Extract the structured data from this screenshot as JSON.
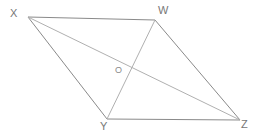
{
  "figure": {
    "background_color": "#ffffff",
    "width": 258,
    "height": 136,
    "side_color": "#8a8a8a",
    "diagonal_color": "#b0b0b0",
    "label_color": "#777777",
    "center_label_color": "#8a8a8a",
    "stroke_width": 1,
    "vertices": [
      {
        "name": "X",
        "label": "X",
        "x": 28,
        "y": 17,
        "label_x": 10,
        "label_y": 8
      },
      {
        "name": "W",
        "label": "W",
        "x": 155,
        "y": 20,
        "label_x": 158,
        "label_y": 5
      },
      {
        "name": "Y",
        "label": "Y",
        "x": 107,
        "y": 119,
        "label_x": 100,
        "label_y": 121
      },
      {
        "name": "Z",
        "label": "Z",
        "x": 240,
        "y": 120,
        "label_x": 241,
        "label_y": 119
      }
    ],
    "center": {
      "name": "O",
      "label": "O",
      "x": 133,
      "y": 70,
      "label_x": 115,
      "label_y": 66
    },
    "sides": [
      {
        "name": "XW",
        "from": "X",
        "to": "W",
        "x1": 28,
        "y1": 17,
        "x2": 155,
        "y2": 20
      },
      {
        "name": "WZ",
        "from": "W",
        "to": "Z",
        "x1": 155,
        "y1": 20,
        "x2": 240,
        "y2": 120
      },
      {
        "name": "YZ",
        "from": "Y",
        "to": "Z",
        "x1": 107,
        "y1": 119,
        "x2": 240,
        "y2": 120
      },
      {
        "name": "XY",
        "from": "X",
        "to": "Y",
        "x1": 28,
        "y1": 17,
        "x2": 107,
        "y2": 119
      }
    ],
    "diagonals": [
      {
        "name": "XZ",
        "from": "X",
        "to": "Z",
        "x1": 28,
        "y1": 17,
        "x2": 240,
        "y2": 120
      },
      {
        "name": "WY",
        "from": "W",
        "to": "Y",
        "x1": 155,
        "y1": 20,
        "x2": 107,
        "y2": 119
      }
    ]
  }
}
